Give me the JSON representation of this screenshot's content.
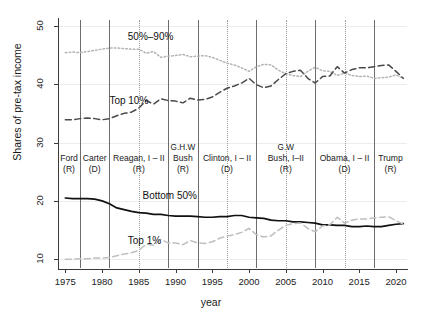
{
  "chart_data": {
    "type": "line",
    "title": "",
    "xlabel": "year",
    "ylabel": "Shares of pre-tax income",
    "xlim": [
      1974,
      2021.5
    ],
    "ylim": [
      8.5,
      51
    ],
    "xticks": [
      1975,
      1980,
      1985,
      1990,
      1995,
      2000,
      2005,
      2010,
      2015,
      2020
    ],
    "yticks": [
      10,
      20,
      30,
      40,
      50
    ],
    "grid": "faint horizontal gridlines at y ticks",
    "legend": "inline series annotations",
    "x": [
      1975,
      1976,
      1977,
      1978,
      1979,
      1980,
      1981,
      1982,
      1983,
      1984,
      1985,
      1986,
      1987,
      1988,
      1989,
      1990,
      1991,
      1992,
      1993,
      1994,
      1995,
      1996,
      1997,
      1998,
      1999,
      2000,
      2001,
      2002,
      2003,
      2004,
      2005,
      2006,
      2007,
      2008,
      2009,
      2010,
      2011,
      2012,
      2013,
      2014,
      2015,
      2016,
      2017,
      2018,
      2019,
      2020,
      2021
    ],
    "series": [
      {
        "name": "50%-90%",
        "label": "50%–90%",
        "style": "dotted",
        "color": "#b4b4b4",
        "values": [
          45.4,
          45.5,
          45.4,
          45.6,
          45.8,
          46.0,
          46.2,
          46.2,
          46.1,
          46.0,
          46.0,
          45.3,
          45.6,
          44.6,
          44.8,
          44.9,
          45.1,
          44.7,
          44.8,
          44.9,
          44.6,
          44.1,
          43.6,
          43.3,
          42.8,
          42.2,
          43.0,
          43.4,
          43.3,
          42.4,
          41.8,
          41.5,
          41.3,
          42.2,
          42.9,
          42.3,
          42.2,
          41.5,
          41.9,
          41.5,
          41.3,
          41.4,
          41.0,
          41.1,
          41.2,
          41.6,
          41.0
        ]
      },
      {
        "name": "Top 10%",
        "label": "Top 10%",
        "style": "dashed",
        "color": "#4a4a4a",
        "values": [
          33.9,
          33.9,
          34.1,
          34.2,
          34.1,
          33.9,
          34.1,
          34.6,
          35.0,
          35.2,
          35.9,
          37.2,
          36.6,
          37.5,
          37.2,
          37.1,
          36.8,
          37.6,
          37.3,
          37.4,
          37.8,
          38.6,
          39.3,
          39.7,
          40.2,
          41.0,
          39.9,
          39.4,
          39.7,
          40.8,
          41.8,
          42.2,
          42.4,
          41.0,
          40.2,
          41.3,
          41.4,
          43.0,
          41.9,
          42.5,
          42.8,
          42.8,
          43.0,
          43.2,
          43.3,
          42.2,
          41.0
        ]
      },
      {
        "name": "Bottom 50%",
        "label": "Bottom 50%",
        "style": "solid",
        "color": "#111111",
        "values": [
          20.5,
          20.4,
          20.4,
          20.4,
          20.3,
          20.0,
          19.5,
          18.8,
          18.5,
          18.2,
          18.0,
          17.9,
          17.7,
          17.7,
          17.5,
          17.4,
          17.4,
          17.4,
          17.3,
          17.2,
          17.2,
          17.3,
          17.3,
          17.5,
          17.5,
          17.2,
          17.1,
          17.0,
          16.7,
          16.6,
          16.6,
          16.4,
          16.4,
          16.3,
          16.2,
          15.9,
          15.9,
          15.8,
          15.8,
          15.6,
          15.6,
          15.7,
          15.6,
          15.6,
          15.8,
          16.0,
          16.1
        ]
      },
      {
        "name": "Top 1%",
        "label": "Top 1%",
        "style": "dashed",
        "color": "#bfbfbf",
        "values": [
          10.0,
          10.0,
          10.1,
          10.1,
          10.2,
          10.2,
          10.3,
          10.6,
          10.9,
          11.1,
          11.5,
          12.6,
          12.4,
          13.4,
          12.8,
          12.8,
          12.5,
          13.2,
          12.8,
          12.7,
          13.0,
          13.6,
          14.0,
          14.2,
          14.6,
          15.3,
          14.2,
          13.8,
          14.0,
          15.0,
          15.8,
          16.1,
          16.2,
          15.3,
          14.7,
          15.7,
          15.9,
          17.2,
          16.2,
          16.7,
          16.9,
          16.9,
          17.1,
          17.2,
          17.3,
          16.6,
          16.0
        ]
      }
    ],
    "annotations": [
      {
        "text": "50%–90%",
        "x": 1983.5,
        "y": 48.0
      },
      {
        "text": "Top 10%",
        "x": 1981.0,
        "y": 37.0
      },
      {
        "text": "Bottom 50%",
        "x": 1985.5,
        "y": 20.6
      },
      {
        "text": "Top 1%",
        "x": 1983.5,
        "y": 13.0
      }
    ],
    "presidents": [
      {
        "name": "Ford",
        "sup": "",
        "party": "(R)",
        "start": 1974,
        "end": 1977,
        "boundary": "solid"
      },
      {
        "name": "Carter",
        "sup": "",
        "party": "(D)",
        "start": 1977,
        "end": 1981,
        "boundary": "solid"
      },
      {
        "name": "Reagan, I – II",
        "sup": "",
        "party": "(R)",
        "start": 1981,
        "end": 1989,
        "boundary": "solid",
        "midline": 1985
      },
      {
        "name": "Bush",
        "sup": "G.H.W",
        "party": "(R)",
        "start": 1989,
        "end": 1993,
        "boundary": "solid"
      },
      {
        "name": "Clinton, I – II",
        "sup": "",
        "party": "(D)",
        "start": 1993,
        "end": 2001,
        "boundary": "dotted",
        "midline": 1997
      },
      {
        "name": "Bush, I–II",
        "sup": "G.W",
        "party": "(R)",
        "start": 2001,
        "end": 2009,
        "boundary": "solid",
        "midline": 2005
      },
      {
        "name": "Obama, I – II",
        "sup": "",
        "party": "(D)",
        "start": 2009,
        "end": 2017,
        "boundary": "solid",
        "midline": 2013
      },
      {
        "name": "Trump",
        "sup": "",
        "party": "(R)",
        "start": 2017,
        "end": 2021.5,
        "boundary": "solid"
      }
    ]
  }
}
